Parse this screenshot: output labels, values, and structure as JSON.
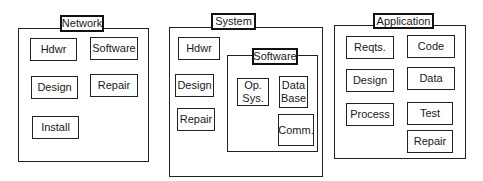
{
  "diagram": {
    "panels": [
      {
        "id": "network",
        "title": "Network",
        "frame": {
          "x": 18,
          "y": 28,
          "w": 131,
          "h": 134
        },
        "title_box": {
          "x": 60,
          "y": 15,
          "w": 44,
          "h": 17
        },
        "nodes": [
          {
            "label": "Hdwr",
            "x": 30,
            "y": 38,
            "w": 47,
            "h": 23
          },
          {
            "label": "Software",
            "x": 90,
            "y": 37,
            "w": 48,
            "h": 23
          },
          {
            "label": "Design",
            "x": 31,
            "y": 76,
            "w": 47,
            "h": 23
          },
          {
            "label": "Repair",
            "x": 90,
            "y": 74,
            "w": 48,
            "h": 23
          },
          {
            "label": "Install",
            "x": 32,
            "y": 116,
            "w": 47,
            "h": 23
          }
        ]
      },
      {
        "id": "system",
        "title": "System",
        "frame": {
          "x": 169,
          "y": 27,
          "w": 154,
          "h": 150
        },
        "title_box": {
          "x": 211,
          "y": 13,
          "w": 45,
          "h": 17
        },
        "nodes": [
          {
            "label": "Hdwr",
            "x": 178,
            "y": 37,
            "w": 42,
            "h": 23
          },
          {
            "label": "Design",
            "x": 175,
            "y": 74,
            "w": 39,
            "h": 23
          },
          {
            "label": "Repair",
            "x": 177,
            "y": 108,
            "w": 38,
            "h": 23
          }
        ],
        "subpanel": {
          "id": "software",
          "title": "Software",
          "frame": {
            "x": 227,
            "y": 55,
            "w": 91,
            "h": 97
          },
          "title_box": {
            "x": 252,
            "y": 48,
            "w": 46,
            "h": 17
          },
          "nodes": [
            {
              "label": "Op.\nSys.",
              "x": 237,
              "y": 78,
              "w": 32,
              "h": 28
            },
            {
              "label": "Data\nBase",
              "x": 279,
              "y": 76,
              "w": 29,
              "h": 32
            },
            {
              "label": "Comm.",
              "x": 278,
              "y": 114,
              "w": 36,
              "h": 32
            }
          ]
        }
      },
      {
        "id": "application",
        "title": "Application",
        "frame": {
          "x": 334,
          "y": 25,
          "w": 132,
          "h": 134
        },
        "title_box": {
          "x": 373,
          "y": 13,
          "w": 61,
          "h": 16
        },
        "nodes": [
          {
            "label": "Reqts.",
            "x": 346,
            "y": 36,
            "w": 48,
            "h": 23
          },
          {
            "label": "Code",
            "x": 407,
            "y": 35,
            "w": 48,
            "h": 23
          },
          {
            "label": "Design",
            "x": 346,
            "y": 69,
            "w": 48,
            "h": 23
          },
          {
            "label": "Data",
            "x": 407,
            "y": 67,
            "w": 48,
            "h": 23
          },
          {
            "label": "Process",
            "x": 346,
            "y": 103,
            "w": 48,
            "h": 23
          },
          {
            "label": "Test",
            "x": 407,
            "y": 102,
            "w": 46,
            "h": 23
          },
          {
            "label": "Repair",
            "x": 407,
            "y": 130,
            "w": 46,
            "h": 23
          }
        ]
      }
    ]
  }
}
